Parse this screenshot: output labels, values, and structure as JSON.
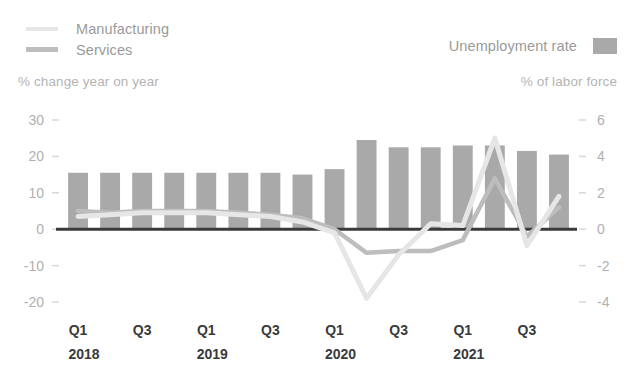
{
  "legend": {
    "manufacturing_label": "Manufacturing",
    "services_label": "Services",
    "unemployment_label": "Unemployment rate"
  },
  "axis_captions": {
    "left": "% change year on year",
    "right": "% of labor force"
  },
  "colors": {
    "manufacturing": "#e6e6e6",
    "services": "#bdbdbd",
    "bars": "#a9a9a9",
    "zero_line": "#3a3a3a",
    "tick_text": "#b0b0b0",
    "x_text": "#3a3a3a"
  },
  "chart_data": {
    "type": "bar",
    "title": "",
    "xlabel": "",
    "ylabel": "% change year on year",
    "y2label": "% of labor force",
    "grid": false,
    "legend_position": "top",
    "categories": [
      "Q1 2018",
      "Q2 2018",
      "Q3 2018",
      "Q4 2018",
      "Q1 2019",
      "Q2 2019",
      "Q3 2019",
      "Q4 2019",
      "Q1 2020",
      "Q2 2020",
      "Q3 2020",
      "Q4 2020",
      "Q1 2021",
      "Q2 2021",
      "Q3 2021",
      "Q4 2021"
    ],
    "ylim": [
      -20,
      30
    ],
    "yticks": [
      30,
      20,
      10,
      0,
      -10,
      -20
    ],
    "y2lim": [
      -4,
      6
    ],
    "y2ticks": [
      6,
      4,
      2,
      0,
      -2,
      -4
    ],
    "xtick_quarters": [
      "Q1",
      "Q3",
      "Q1",
      "Q3",
      "Q1",
      "Q3",
      "Q1",
      "Q3"
    ],
    "xtick_years": [
      "2018",
      "2019",
      "2020",
      "2021"
    ],
    "series": [
      {
        "name": "Unemployment rate",
        "type": "bar",
        "axis": "right",
        "unit": "% of labor force",
        "values": [
          3.1,
          3.1,
          3.1,
          3.1,
          3.1,
          3.1,
          3.1,
          3.0,
          3.3,
          4.9,
          4.5,
          4.5,
          4.6,
          4.6,
          4.3,
          4.1
        ]
      },
      {
        "name": "Manufacturing",
        "type": "line",
        "axis": "left",
        "unit": "% change year on year",
        "values": [
          3.5,
          4.0,
          4.5,
          4.5,
          4.5,
          4.0,
          3.5,
          2.0,
          -1.0,
          -19.0,
          -7.0,
          1.5,
          1.0,
          25.0,
          -4.5,
          9.0
        ]
      },
      {
        "name": "Services",
        "type": "line",
        "axis": "left",
        "unit": "% change year on year",
        "values": [
          5.0,
          4.5,
          5.0,
          5.0,
          5.0,
          4.5,
          4.0,
          3.0,
          0.0,
          -6.5,
          -6.0,
          -6.0,
          -3.0,
          14.0,
          -2.0,
          6.0
        ]
      }
    ]
  }
}
